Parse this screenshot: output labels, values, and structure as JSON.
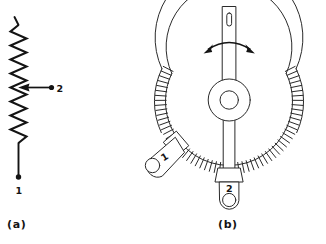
{
  "figure": {
    "background_color": "#ffffff",
    "ink_color": "#141414",
    "line_color_b": "#2a2a2a",
    "width": 326,
    "height": 244
  },
  "panel_a": {
    "caption": "(a)",
    "description": "schematic-symbol-resistive-element-with-wiper",
    "terminal_bottom_label": "1",
    "wiper_label": "2",
    "zigzag_peaks": 13,
    "icons": {
      "zigzag": "resistor-zigzag-icon",
      "wiper": "wiper-arrow-icon",
      "terminal_dot": "terminal-dot-icon"
    }
  },
  "panel_b": {
    "caption": "(b)",
    "description": "physical-construction-wirewound-rheostat",
    "terminal_left_label": "1",
    "terminal_bottom_label": "2",
    "rotation_arrow": "double-headed-curved-arrow",
    "winding_turn_count": 60,
    "icons": {
      "coil": "resistance-winding-icon",
      "arm": "wiper-arm-icon",
      "hub": "rotor-hub-icon",
      "lug1": "solder-lug-terminal-1-icon",
      "lug2": "solder-lug-terminal-2-icon",
      "rotation": "rotation-arrow-icon",
      "slot": "screwdriver-slot-icon"
    }
  }
}
